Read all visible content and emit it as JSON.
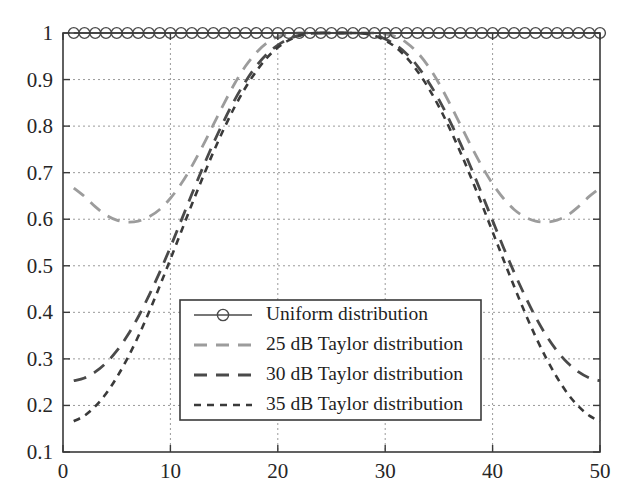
{
  "chart_data": {
    "type": "line",
    "title": "",
    "subtitle": "",
    "xlabel": "",
    "ylabel": "",
    "xlim": [
      0,
      50
    ],
    "ylim": [
      0.1,
      1
    ],
    "xticks": [
      0,
      10,
      20,
      30,
      40,
      50
    ],
    "yticks": [
      0.1,
      0.2,
      0.3,
      0.4,
      0.5,
      0.6,
      0.7,
      0.8,
      0.9,
      1
    ],
    "xtick_labels": [
      "0",
      "10",
      "20",
      "30",
      "40",
      "50"
    ],
    "ytick_labels": [
      "0.1",
      "0.2",
      "0.3",
      "0.4",
      "0.5",
      "0.6",
      "0.7",
      "0.8",
      "0.9",
      "1"
    ],
    "grid": true,
    "grid_style": "dotted",
    "legend_position": "center-left-lower",
    "x": [
      1,
      2,
      3,
      4,
      5,
      6,
      7,
      8,
      9,
      10,
      11,
      12,
      13,
      14,
      15,
      16,
      17,
      18,
      19,
      20,
      21,
      22,
      23,
      24,
      25,
      26,
      27,
      28,
      29,
      30,
      31,
      32,
      33,
      34,
      35,
      36,
      37,
      38,
      39,
      40,
      41,
      42,
      43,
      44,
      45,
      46,
      47,
      48,
      49,
      50
    ],
    "series": [
      {
        "name": "Uniform distribution",
        "style": "solid-circles",
        "color": "#4a4a4a",
        "marker": "circle",
        "values": [
          1,
          1,
          1,
          1,
          1,
          1,
          1,
          1,
          1,
          1,
          1,
          1,
          1,
          1,
          1,
          1,
          1,
          1,
          1,
          1,
          1,
          1,
          1,
          1,
          1,
          1,
          1,
          1,
          1,
          1,
          1,
          1,
          1,
          1,
          1,
          1,
          1,
          1,
          1,
          1,
          1,
          1,
          1,
          1,
          1,
          1,
          1,
          1,
          1,
          1
        ]
      },
      {
        "name": "25 dB Taylor distribution",
        "style": "long-dash",
        "color": "#9c9c9c",
        "marker": "none",
        "values": [
          0.667,
          0.649,
          0.627,
          0.609,
          0.598,
          0.594,
          0.596,
          0.605,
          0.621,
          0.645,
          0.676,
          0.714,
          0.757,
          0.803,
          0.849,
          0.892,
          0.929,
          0.958,
          0.979,
          0.992,
          0.998,
          1.0,
          1.0,
          1.0,
          1.0,
          1.0,
          1.0,
          1.0,
          1.0,
          0.998,
          0.992,
          0.979,
          0.958,
          0.929,
          0.892,
          0.849,
          0.803,
          0.757,
          0.714,
          0.676,
          0.645,
          0.621,
          0.605,
          0.596,
          0.594,
          0.598,
          0.609,
          0.627,
          0.649,
          0.667
        ]
      },
      {
        "name": "30 dB Taylor distribution",
        "style": "long-dash",
        "color": "#4a4a4a",
        "marker": "none",
        "values": [
          0.253,
          0.259,
          0.272,
          0.291,
          0.317,
          0.35,
          0.39,
          0.436,
          0.486,
          0.54,
          0.597,
          0.654,
          0.71,
          0.763,
          0.812,
          0.857,
          0.896,
          0.929,
          0.955,
          0.974,
          0.987,
          0.995,
          0.999,
          1.0,
          1.0,
          1.0,
          1.0,
          0.999,
          0.995,
          0.987,
          0.974,
          0.955,
          0.929,
          0.896,
          0.857,
          0.812,
          0.763,
          0.71,
          0.654,
          0.597,
          0.54,
          0.486,
          0.436,
          0.39,
          0.35,
          0.317,
          0.291,
          0.272,
          0.259,
          0.253
        ]
      },
      {
        "name": "35 dB Taylor distribution",
        "style": "short-dash",
        "color": "#3a3a3a",
        "marker": "none",
        "values": [
          0.166,
          0.178,
          0.198,
          0.225,
          0.26,
          0.301,
          0.348,
          0.4,
          0.456,
          0.514,
          0.573,
          0.632,
          0.689,
          0.744,
          0.795,
          0.842,
          0.883,
          0.918,
          0.947,
          0.969,
          0.984,
          0.994,
          0.999,
          1.0,
          1.0,
          1.0,
          1.0,
          0.999,
          0.994,
          0.984,
          0.969,
          0.947,
          0.918,
          0.883,
          0.842,
          0.795,
          0.744,
          0.689,
          0.632,
          0.573,
          0.514,
          0.456,
          0.4,
          0.348,
          0.301,
          0.26,
          0.225,
          0.198,
          0.178,
          0.166
        ]
      }
    ]
  },
  "legend": {
    "entries": [
      {
        "label": "Uniform distribution"
      },
      {
        "label": "25 dB Taylor distribution"
      },
      {
        "label": "30 dB Taylor distribution"
      },
      {
        "label": "35 dB Taylor distribution"
      }
    ]
  },
  "colors": {
    "axis": "#3a3a3a",
    "grid": "#9a9a9a",
    "background": "#ffffff",
    "series_light_gray": "#9c9c9c",
    "series_dark_gray": "#4a4a4a"
  }
}
